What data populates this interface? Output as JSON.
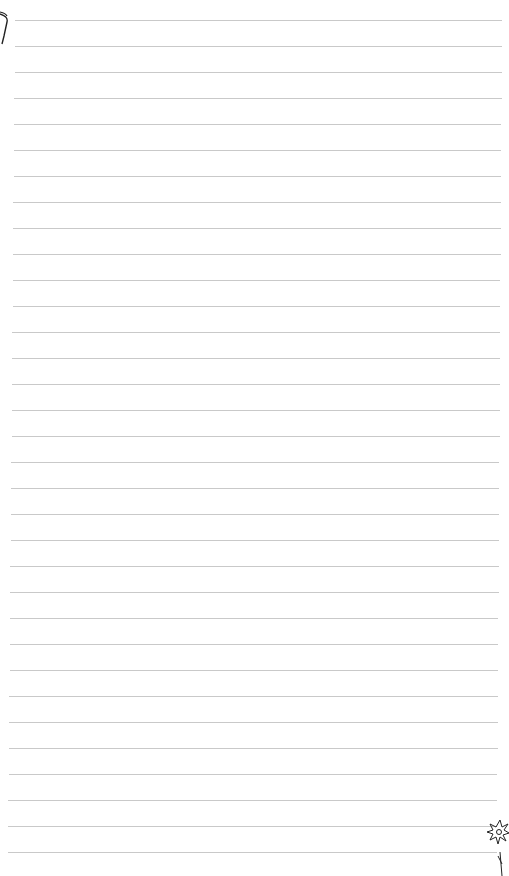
{
  "page": {
    "type": "lined-paper",
    "background": "#ffffff",
    "line_color": "#c9c9c9",
    "line_count": 33,
    "first_line_y": 20,
    "line_spacing": 26,
    "line_start_x_top": 15,
    "line_start_x_bottom": 8,
    "line_end_x_top": 502,
    "line_end_x_bottom": 497
  },
  "decorations": {
    "top_left": "curved-frame-doodle",
    "bottom_right": "flower-doodle"
  }
}
